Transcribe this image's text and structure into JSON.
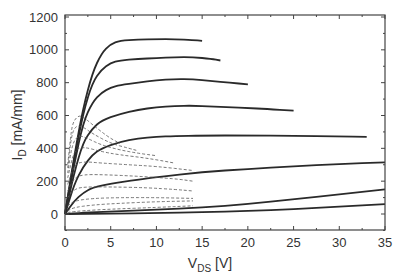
{
  "chart_data": {
    "type": "line",
    "title": "",
    "xlabel": "V_DS [V]",
    "xlabel_main": "V",
    "xlabel_sub": "DS",
    "xlabel_unit": " [V]",
    "ylabel": "I_D [mA/mm]",
    "ylabel_main": "I",
    "ylabel_sub": "D",
    "ylabel_unit": " [mA/mm]",
    "xlim": [
      0,
      35
    ],
    "ylim": [
      -100,
      1200
    ],
    "x_ticks": [
      0,
      5,
      10,
      15,
      20,
      25,
      30,
      35
    ],
    "y_ticks": [
      0,
      200,
      400,
      600,
      800,
      1000,
      1200
    ],
    "grid": false,
    "legend": null,
    "series": [
      {
        "name": "solid-1",
        "style": "solid",
        "points": [
          [
            0,
            0
          ],
          [
            1,
            350
          ],
          [
            2,
            650
          ],
          [
            3,
            860
          ],
          [
            4,
            980
          ],
          [
            5,
            1035
          ],
          [
            6,
            1055
          ],
          [
            8,
            1062
          ],
          [
            10,
            1065
          ],
          [
            12,
            1065
          ],
          [
            14,
            1060
          ],
          [
            15,
            1055
          ]
        ]
      },
      {
        "name": "solid-2",
        "style": "solid",
        "points": [
          [
            0,
            0
          ],
          [
            1,
            330
          ],
          [
            2,
            620
          ],
          [
            3,
            800
          ],
          [
            4,
            880
          ],
          [
            5,
            920
          ],
          [
            6,
            935
          ],
          [
            8,
            945
          ],
          [
            10,
            950
          ],
          [
            12,
            955
          ],
          [
            14,
            955
          ],
          [
            16,
            945
          ],
          [
            17,
            935
          ]
        ]
      },
      {
        "name": "solid-3",
        "style": "solid",
        "points": [
          [
            0,
            0
          ],
          [
            1,
            300
          ],
          [
            2,
            560
          ],
          [
            3,
            680
          ],
          [
            4,
            740
          ],
          [
            5,
            770
          ],
          [
            6,
            785
          ],
          [
            8,
            800
          ],
          [
            10,
            815
          ],
          [
            12,
            822
          ],
          [
            14,
            820
          ],
          [
            16,
            810
          ],
          [
            18,
            800
          ],
          [
            20,
            790
          ]
        ]
      },
      {
        "name": "solid-4",
        "style": "solid",
        "points": [
          [
            0,
            0
          ],
          [
            1,
            250
          ],
          [
            2,
            440
          ],
          [
            3,
            520
          ],
          [
            4,
            570
          ],
          [
            6,
            610
          ],
          [
            8,
            635
          ],
          [
            10,
            650
          ],
          [
            12,
            658
          ],
          [
            14,
            660
          ],
          [
            16,
            655
          ],
          [
            18,
            650
          ],
          [
            20,
            645
          ],
          [
            22,
            640
          ],
          [
            25,
            630
          ]
        ]
      },
      {
        "name": "solid-5",
        "style": "solid",
        "points": [
          [
            0,
            0
          ],
          [
            1,
            180
          ],
          [
            2,
            290
          ],
          [
            3,
            360
          ],
          [
            4,
            400
          ],
          [
            6,
            440
          ],
          [
            8,
            460
          ],
          [
            10,
            470
          ],
          [
            12,
            475
          ],
          [
            15,
            478
          ],
          [
            20,
            478
          ],
          [
            25,
            476
          ],
          [
            30,
            472
          ],
          [
            33,
            470
          ]
        ]
      },
      {
        "name": "solid-6",
        "style": "solid",
        "points": [
          [
            0,
            0
          ],
          [
            1,
            80
          ],
          [
            2,
            130
          ],
          [
            3,
            160
          ],
          [
            5,
            185
          ],
          [
            8,
            210
          ],
          [
            10,
            225
          ],
          [
            15,
            255
          ],
          [
            20,
            275
          ],
          [
            25,
            290
          ],
          [
            30,
            305
          ],
          [
            35,
            315
          ]
        ]
      },
      {
        "name": "solid-7",
        "style": "solid",
        "points": [
          [
            0,
            0
          ],
          [
            2,
            8
          ],
          [
            5,
            15
          ],
          [
            10,
            25
          ],
          [
            15,
            40
          ],
          [
            20,
            60
          ],
          [
            25,
            90
          ],
          [
            30,
            120
          ],
          [
            35,
            150
          ]
        ]
      },
      {
        "name": "solid-8",
        "style": "solid",
        "points": [
          [
            0,
            0
          ],
          [
            5,
            3
          ],
          [
            10,
            6
          ],
          [
            15,
            10
          ],
          [
            20,
            18
          ],
          [
            25,
            30
          ],
          [
            30,
            45
          ],
          [
            35,
            60
          ]
        ]
      },
      {
        "name": "dashed-1",
        "style": "dashed",
        "points": [
          [
            0.3,
            300
          ],
          [
            0.7,
            520
          ],
          [
            1,
            570
          ],
          [
            1.5,
            600
          ],
          [
            2,
            590
          ],
          [
            3,
            545
          ],
          [
            4,
            500
          ],
          [
            5,
            460
          ],
          [
            6,
            430
          ]
        ]
      },
      {
        "name": "dashed-2",
        "style": "dashed",
        "points": [
          [
            0.3,
            280
          ],
          [
            0.7,
            480
          ],
          [
            1.2,
            540
          ],
          [
            2,
            530
          ],
          [
            3,
            490
          ],
          [
            5,
            430
          ],
          [
            7,
            400
          ],
          [
            8,
            385
          ]
        ]
      },
      {
        "name": "dashed-3",
        "style": "dashed",
        "points": [
          [
            0.3,
            250
          ],
          [
            0.8,
            430
          ],
          [
            1.5,
            480
          ],
          [
            2.5,
            460
          ],
          [
            4,
            420
          ],
          [
            6,
            390
          ],
          [
            8,
            370
          ],
          [
            10,
            355
          ]
        ]
      },
      {
        "name": "dashed-4",
        "style": "dashed",
        "points": [
          [
            0.3,
            220
          ],
          [
            1,
            390
          ],
          [
            2,
            410
          ],
          [
            4,
            380
          ],
          [
            6,
            360
          ],
          [
            9,
            340
          ],
          [
            12,
            310
          ]
        ]
      },
      {
        "name": "dashed-5",
        "style": "dashed",
        "points": [
          [
            0.3,
            180
          ],
          [
            1,
            300
          ],
          [
            2,
            320
          ],
          [
            4,
            310
          ],
          [
            7,
            300
          ],
          [
            10,
            290
          ],
          [
            14,
            265
          ]
        ]
      },
      {
        "name": "dashed-6",
        "style": "dashed",
        "points": [
          [
            0.3,
            140
          ],
          [
            1,
            220
          ],
          [
            2,
            240
          ],
          [
            4,
            240
          ],
          [
            8,
            230
          ],
          [
            12,
            215
          ],
          [
            14,
            200
          ]
        ]
      },
      {
        "name": "dashed-7",
        "style": "dashed",
        "points": [
          [
            0.3,
            100
          ],
          [
            1,
            150
          ],
          [
            2,
            165
          ],
          [
            5,
            165
          ],
          [
            9,
            160
          ],
          [
            12,
            150
          ],
          [
            14,
            140
          ]
        ]
      },
      {
        "name": "dashed-8",
        "style": "dashed",
        "points": [
          [
            0.3,
            50
          ],
          [
            1,
            80
          ],
          [
            3,
            95
          ],
          [
            6,
            100
          ],
          [
            10,
            100
          ],
          [
            14,
            95
          ]
        ]
      },
      {
        "name": "dashed-9",
        "style": "dashed",
        "points": [
          [
            0.3,
            20
          ],
          [
            1,
            40
          ],
          [
            3,
            55
          ],
          [
            6,
            65
          ],
          [
            10,
            75
          ],
          [
            14,
            80
          ]
        ]
      },
      {
        "name": "dashed-10",
        "style": "dashed",
        "points": [
          [
            0.3,
            10
          ],
          [
            2,
            20
          ],
          [
            5,
            30
          ],
          [
            10,
            40
          ],
          [
            14,
            50
          ]
        ]
      }
    ]
  }
}
